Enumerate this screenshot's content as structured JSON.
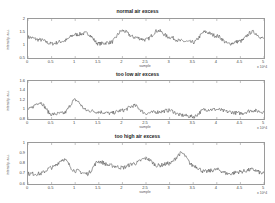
{
  "chart_data": [
    {
      "type": "line",
      "title": "normal air excess",
      "xlabel": "sample",
      "ylabel": "intensity, a.u.",
      "x_multiplier": "x 10^4",
      "xlim": [
        0,
        5
      ],
      "ylim": [
        0.5,
        2
      ],
      "xticks": [
        "0",
        "0.5",
        "1",
        "1.5",
        "2",
        "2.5",
        "3",
        "3.5",
        "4",
        "4.5",
        "5"
      ],
      "yticks": [
        "0.5",
        "1",
        "1.5",
        "2"
      ],
      "grid": false,
      "x": [
        0,
        0.25,
        0.5,
        0.75,
        1.0,
        1.25,
        1.5,
        1.75,
        2.0,
        2.25,
        2.5,
        2.75,
        3.0,
        3.25,
        3.5,
        3.75,
        4.0,
        4.25,
        4.5,
        4.75,
        5.0
      ],
      "series": [
        {
          "name": "signal",
          "values": [
            1.3,
            1.2,
            1.05,
            1.15,
            1.4,
            1.45,
            1.05,
            1.1,
            1.55,
            1.3,
            1.2,
            1.55,
            1.3,
            1.15,
            1.1,
            1.5,
            1.35,
            1.05,
            1.15,
            1.5,
            1.25
          ]
        }
      ]
    },
    {
      "type": "line",
      "title": "too low air excess",
      "xlabel": "sample",
      "ylabel": "intensity, a.u.",
      "x_multiplier": "x 10^4",
      "xlim": [
        0,
        5
      ],
      "ylim": [
        0.8,
        1.6
      ],
      "xticks": [
        "0",
        "0.5",
        "1",
        "1.5",
        "2",
        "2.5",
        "3",
        "3.5",
        "4",
        "4.5",
        "5"
      ],
      "yticks": [
        "0.8",
        "1",
        "1.2",
        "1.4",
        "1.6"
      ],
      "grid": false,
      "x": [
        0,
        0.25,
        0.5,
        0.75,
        1.0,
        1.25,
        1.5,
        1.75,
        2.0,
        2.25,
        2.5,
        2.75,
        3.0,
        3.25,
        3.5,
        3.75,
        4.0,
        4.25,
        4.5,
        4.75,
        5.0
      ],
      "series": [
        {
          "name": "signal",
          "values": [
            1.0,
            1.15,
            0.9,
            0.92,
            1.2,
            0.98,
            0.95,
            0.92,
            0.98,
            1.08,
            0.92,
            0.95,
            0.98,
            0.88,
            0.85,
            1.0,
            1.0,
            0.95,
            0.92,
            0.98,
            0.95
          ]
        }
      ]
    },
    {
      "type": "line",
      "title": "too high air excess",
      "xlabel": "sample",
      "ylabel": "intensity, a.u.",
      "x_multiplier": "x 10^4",
      "xlim": [
        0,
        5
      ],
      "ylim": [
        0.6,
        1.0
      ],
      "xticks": [
        "0",
        "0.5",
        "1",
        "1.5",
        "2",
        "2.5",
        "3",
        "3.5",
        "4",
        "4.5",
        "5"
      ],
      "yticks": [
        "0.6",
        "0.7",
        "0.8",
        "0.9",
        "1"
      ],
      "grid": false,
      "x": [
        0,
        0.25,
        0.5,
        0.75,
        1.0,
        1.25,
        1.5,
        1.75,
        2.0,
        2.25,
        2.5,
        2.75,
        3.0,
        3.25,
        3.5,
        3.75,
        4.0,
        4.25,
        4.5,
        4.75,
        5.0
      ],
      "series": [
        {
          "name": "signal",
          "values": [
            0.7,
            0.7,
            0.76,
            0.84,
            0.73,
            0.7,
            0.82,
            0.78,
            0.76,
            0.8,
            0.85,
            0.78,
            0.8,
            0.9,
            0.78,
            0.72,
            0.74,
            0.7,
            0.72,
            0.74,
            0.7
          ]
        }
      ]
    }
  ]
}
